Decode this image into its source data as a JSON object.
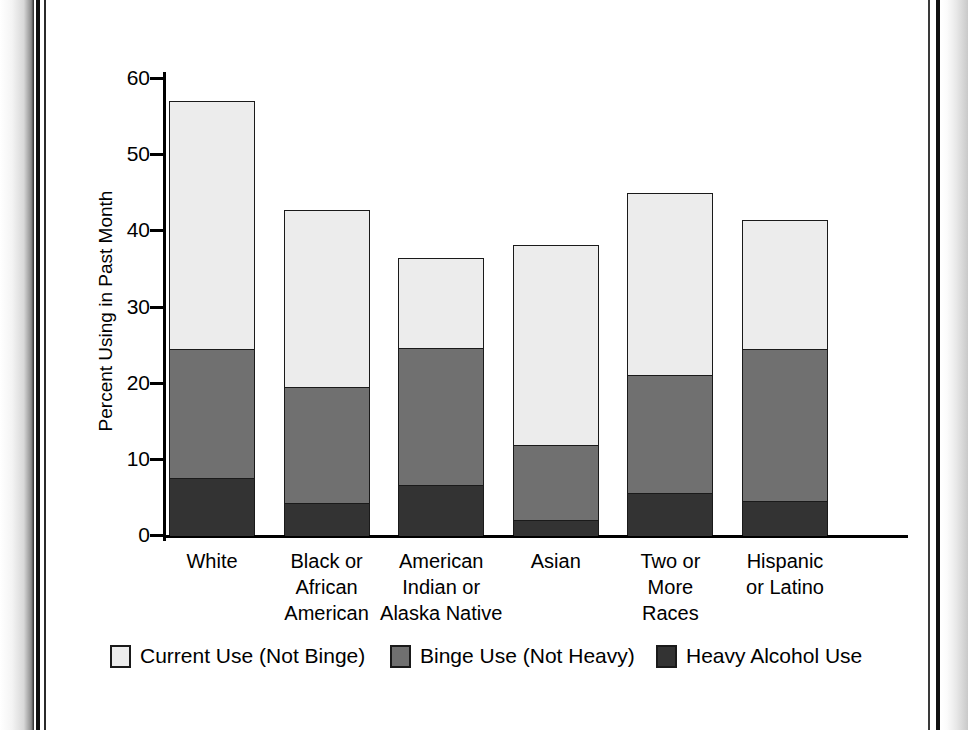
{
  "chart_data": {
    "type": "bar",
    "subtype": "stacked",
    "title": "",
    "xlabel": "",
    "ylabel": "Percent Using in Past Month",
    "ylim": [
      0,
      60
    ],
    "yticks": [
      0,
      10,
      20,
      30,
      40,
      50,
      60
    ],
    "grid": false,
    "legend_position": "bottom",
    "categories": [
      "White",
      "Black or African American",
      "American Indian or Alaska Native",
      "Asian",
      "Two or More Races",
      "Hispanic or Latino"
    ],
    "category_lines": [
      [
        "White"
      ],
      [
        "Black or",
        "African",
        "American"
      ],
      [
        "American",
        "Indian or",
        "Alaska Native"
      ],
      [
        "Asian"
      ],
      [
        "Two or",
        "More",
        "Races"
      ],
      [
        "Hispanic",
        "or Latino"
      ]
    ],
    "series": [
      {
        "name": "Heavy Alcohol Use",
        "color": "#333333",
        "values": [
          7.6,
          4.3,
          6.7,
          2.1,
          5.6,
          4.6
        ]
      },
      {
        "name": "Binge Use (Not Heavy)",
        "color": "#707070",
        "values": [
          16.9,
          15.3,
          18.0,
          9.9,
          15.6,
          20.0
        ]
      },
      {
        "name": "Current Use (Not Binge)",
        "color": "#ECECEC",
        "values": [
          32.5,
          23.1,
          11.7,
          26.1,
          23.7,
          16.7
        ]
      }
    ],
    "cumulative_tops": {
      "heavy": [
        7.6,
        4.3,
        6.7,
        2.1,
        5.6,
        4.6
      ],
      "binge": [
        24.5,
        19.6,
        24.7,
        12.0,
        21.2,
        24.6
      ],
      "total": [
        57.0,
        42.7,
        36.4,
        38.1,
        44.9,
        41.3
      ]
    }
  },
  "legend": {
    "items": [
      {
        "label": "Current Use (Not Binge)",
        "color": "#ECECEC",
        "swatch": "legend-swatch-light"
      },
      {
        "label": "Binge Use (Not Heavy)",
        "color": "#707070",
        "swatch": "legend-swatch-medium"
      },
      {
        "label": "Heavy Alcohol Use",
        "color": "#333333",
        "swatch": "legend-swatch-dark"
      }
    ]
  },
  "axis": {
    "y_title": "Percent Using in Past Month",
    "y_tick_labels": [
      "60",
      "50",
      "40",
      "30",
      "20",
      "10",
      "0"
    ]
  }
}
